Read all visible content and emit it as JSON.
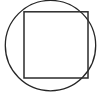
{
  "figure": {
    "title": "Circle with inscribed square",
    "background_color": "#ffffff",
    "width": 101,
    "height": 95,
    "shapes": [
      {
        "name": "circle",
        "type": "circle",
        "cx": 50.5,
        "cy": 45.6,
        "r": 45.2,
        "stroke_color": "#262626",
        "stroke_width": 1.3,
        "fill": "none"
      },
      {
        "name": "square",
        "type": "rect",
        "x": 24.0,
        "y": 11.8,
        "width": 64.0,
        "height": 66.2,
        "stroke_color": "#2b2b2b",
        "stroke_width": 1.5,
        "fill": "none"
      }
    ]
  },
  "chart_data": {
    "type": "diagram",
    "title": "Circle with inscribed square",
    "elements": [
      {
        "label": "circle",
        "center": [
          50.5,
          45.6
        ],
        "radius": 45.2,
        "diameter": 90.4
      },
      {
        "label": "square",
        "top_left": [
          24.0,
          11.8
        ],
        "bottom_right": [
          88.0,
          78.0
        ],
        "side_width": 64.0,
        "side_height": 66.2
      }
    ],
    "xlabel": "",
    "ylabel": "",
    "xlim": [
      0,
      101
    ],
    "ylim": [
      0,
      95
    ],
    "grid": false,
    "legend": "none"
  }
}
